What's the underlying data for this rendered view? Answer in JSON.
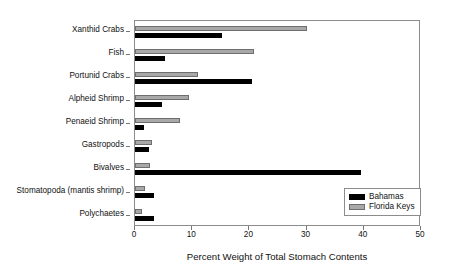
{
  "chart_data": {
    "type": "bar",
    "orientation": "horizontal",
    "title": "",
    "xlabel": "Percent Weight of Total Stomach Contents",
    "ylabel": "",
    "xlim": [
      0,
      50
    ],
    "xticks": [
      0,
      10,
      20,
      30,
      40,
      50
    ],
    "xtick_labels": [
      "0",
      "10",
      "20",
      "30",
      "40",
      "50"
    ],
    "grid": false,
    "legend_position": "lower-right",
    "categories": [
      "Xanthid Crabs",
      "Fish",
      "Portunid Crabs",
      "Alpheid Shrimp",
      "Penaeid Shrimp",
      "Gastropods",
      "Bivalves",
      "Stomatopoda (mantis shrimp)",
      "Polychaetes"
    ],
    "series": [
      {
        "name": "Bahamas",
        "color": "#000000",
        "values": [
          15.2,
          5.2,
          20.5,
          4.8,
          1.6,
          2.4,
          39.5,
          3.4,
          3.3
        ]
      },
      {
        "name": "Florida Keys",
        "color": "#a8a8a8",
        "values": [
          30.0,
          20.8,
          11.1,
          9.4,
          7.9,
          2.9,
          2.6,
          1.8,
          1.3
        ]
      }
    ]
  },
  "legend": {
    "entries": [
      {
        "label": "Bahamas"
      },
      {
        "label": "Florida Keys"
      }
    ]
  }
}
